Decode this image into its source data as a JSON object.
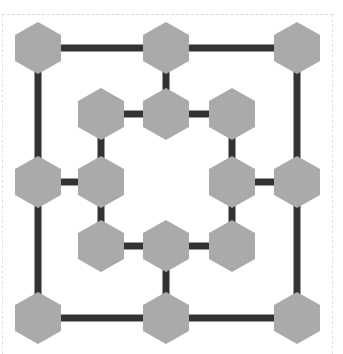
{
  "game": {
    "name": "Nine Men's Morris board",
    "colors": {
      "background": "#ffffff",
      "line": "#333333",
      "node_fill": "#aaaaaa",
      "frame_border": "#d6d6d6"
    },
    "line_width": 7,
    "node": {
      "shape": "hexagon-pointy-top",
      "width": 46,
      "height": 52
    },
    "nodes": [
      {
        "id": "o-tl",
        "ring": "outer",
        "x": 38,
        "y": 48
      },
      {
        "id": "o-tm",
        "ring": "outer",
        "x": 166,
        "y": 48
      },
      {
        "id": "o-tr",
        "ring": "outer",
        "x": 297,
        "y": 48
      },
      {
        "id": "o-ml",
        "ring": "outer",
        "x": 38,
        "y": 182
      },
      {
        "id": "o-mr",
        "ring": "outer",
        "x": 297,
        "y": 182
      },
      {
        "id": "o-bl",
        "ring": "outer",
        "x": 38,
        "y": 318
      },
      {
        "id": "o-bm",
        "ring": "outer",
        "x": 166,
        "y": 318
      },
      {
        "id": "o-br",
        "ring": "outer",
        "x": 297,
        "y": 318
      },
      {
        "id": "i-tl",
        "ring": "inner",
        "x": 101,
        "y": 114
      },
      {
        "id": "i-tm",
        "ring": "inner",
        "x": 166,
        "y": 114
      },
      {
        "id": "i-tr",
        "ring": "inner",
        "x": 232,
        "y": 114
      },
      {
        "id": "i-ml",
        "ring": "inner",
        "x": 101,
        "y": 182
      },
      {
        "id": "i-mr",
        "ring": "inner",
        "x": 232,
        "y": 182
      },
      {
        "id": "i-bl",
        "ring": "inner",
        "x": 101,
        "y": 246
      },
      {
        "id": "i-bm",
        "ring": "inner",
        "x": 166,
        "y": 246
      },
      {
        "id": "i-br",
        "ring": "inner",
        "x": 232,
        "y": 246
      }
    ],
    "edges": [
      [
        "o-tl",
        "o-tm"
      ],
      [
        "o-tm",
        "o-tr"
      ],
      [
        "o-tr",
        "o-mr"
      ],
      [
        "o-mr",
        "o-br"
      ],
      [
        "o-br",
        "o-bm"
      ],
      [
        "o-bm",
        "o-bl"
      ],
      [
        "o-bl",
        "o-ml"
      ],
      [
        "o-ml",
        "o-tl"
      ],
      [
        "i-tl",
        "i-tm"
      ],
      [
        "i-tm",
        "i-tr"
      ],
      [
        "i-tr",
        "i-mr"
      ],
      [
        "i-mr",
        "i-br"
      ],
      [
        "i-br",
        "i-bm"
      ],
      [
        "i-bm",
        "i-bl"
      ],
      [
        "i-bl",
        "i-ml"
      ],
      [
        "i-ml",
        "i-tl"
      ],
      [
        "o-tm",
        "i-tm"
      ],
      [
        "o-ml",
        "i-ml"
      ],
      [
        "o-mr",
        "i-mr"
      ],
      [
        "o-bm",
        "i-bm"
      ]
    ]
  }
}
